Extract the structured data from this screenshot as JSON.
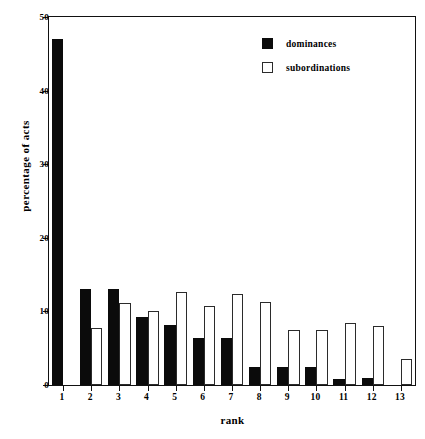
{
  "chart_data": {
    "type": "bar",
    "title": "",
    "subtitle": "",
    "xlabel": "rank",
    "ylabel": "percentage of acts",
    "categories": [
      "1",
      "2",
      "3",
      "4",
      "5",
      "6",
      "7",
      "8",
      "9",
      "10",
      "11",
      "12",
      "13"
    ],
    "series": [
      {
        "name": "dominances",
        "color": "#0b0b0b",
        "fill": "solid",
        "values": [
          47,
          13,
          13,
          9.2,
          8.2,
          6.4,
          6.4,
          2.4,
          2.4,
          2.4,
          0.8,
          0.9,
          0
        ]
      },
      {
        "name": "subordinations",
        "color": "#ffffff",
        "fill": "open",
        "values": [
          0,
          7.7,
          11.2,
          10,
          12.7,
          10.7,
          12.3,
          11.3,
          7.5,
          7.5,
          8.4,
          8,
          3.6
        ]
      }
    ],
    "ylim": [
      0,
      50
    ],
    "yticks": [
      0,
      10,
      20,
      30,
      40,
      50
    ],
    "ytick_labels": [
      "0",
      "10",
      "20",
      "30",
      "40",
      "50"
    ],
    "grid": false,
    "legend_position": "top-right",
    "legend_entries": [
      "dominances",
      "subordinations"
    ]
  }
}
